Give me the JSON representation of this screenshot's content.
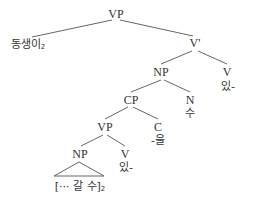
{
  "tree": {
    "root": {
      "label": "VP"
    },
    "subject": {
      "text": "동생이",
      "index": "2"
    },
    "vbar": {
      "label": "V'"
    },
    "np_top": {
      "label": "NP"
    },
    "v_top": {
      "label": "V",
      "word": "있-"
    },
    "cp": {
      "label": "CP"
    },
    "n": {
      "label": "N",
      "word": "수"
    },
    "vp_inner": {
      "label": "VP"
    },
    "c": {
      "label": "C",
      "word": "-을"
    },
    "np_inner": {
      "label": "NP",
      "word": "[··· 갈 수]",
      "index": "2"
    },
    "v_inner": {
      "label": "V",
      "word": "있-"
    }
  },
  "colors": {
    "line": "#555555",
    "text": "#333333"
  }
}
